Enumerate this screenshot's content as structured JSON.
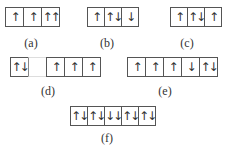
{
  "diagrams": [
    {
      "id": "a",
      "label": "(a)",
      "cells": [
        "↑",
        "↑",
        "↑↑"
      ]
    },
    {
      "id": "b",
      "label": "(b)",
      "cells": [
        "↑",
        "↑↓",
        "↓"
      ]
    },
    {
      "id": "c",
      "label": "(c)",
      "cells": [
        "↑",
        "↑↓",
        "↑"
      ]
    },
    {
      "id": "d",
      "label": "(d)",
      "cells": [
        "↑↓",
        "",
        "↑",
        "↑",
        "↑"
      ]
    },
    {
      "id": "e",
      "label": "(e)",
      "cells": [
        "↑",
        "↑",
        "↑",
        "↓",
        "↑↓"
      ]
    },
    {
      "id": "f",
      "label": "(f)",
      "cells": [
        "↑↓",
        "↑↓",
        "↓↓",
        "↑↓",
        "↑↓"
      ]
    }
  ]
}
